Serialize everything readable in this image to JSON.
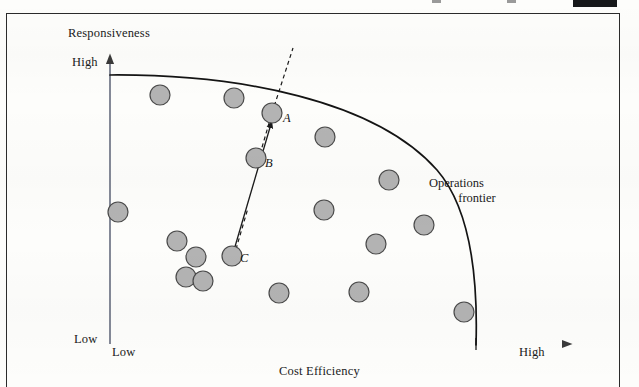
{
  "figure": {
    "kind": "operations-frontier-scatter",
    "frame_border_color": "#2b2b2b",
    "background_color": "#fdfdfb"
  },
  "axes": {
    "y_title": "Responsiveness",
    "y_high": "High",
    "y_low": "Low",
    "x_title": "Cost Efficiency",
    "x_low": "Low",
    "x_high": "High",
    "axis_color": "#3a3a3a"
  },
  "annotations": {
    "frontier_label_line1": "Operations",
    "frontier_label_line2": "frontier",
    "point_a_label": "A",
    "point_b_label": "B",
    "point_c_label": "C"
  },
  "style": {
    "circle_fill": "#b3b3b3",
    "circle_stroke": "#4a4a4a",
    "frontier_stroke": "#141414",
    "arrow_stroke": "#1a1a1a"
  },
  "chart_data": {
    "type": "scatter",
    "title": "",
    "xlabel": "Cost Efficiency",
    "ylabel": "Responsiveness",
    "xlim": [
      "Low",
      "High"
    ],
    "ylim": [
      "Low",
      "High"
    ],
    "grid": false,
    "legend": null,
    "annotations": [
      {
        "text": "Operations frontier",
        "x": 470,
        "y": 190
      },
      {
        "text": "A",
        "x": 283,
        "y": 118
      },
      {
        "text": "B",
        "x": 265,
        "y": 163
      },
      {
        "text": "C",
        "x": 240,
        "y": 258
      }
    ],
    "frontier_curve": {
      "description": "Concave operations frontier arc from upper-left to lower-right",
      "start": [
        110,
        75
      ],
      "control_1": [
        330,
        80
      ],
      "control_2": [
        470,
        160
      ],
      "end": [
        476,
        344
      ]
    },
    "improvement_arrow": {
      "from_point": "C",
      "through_point": "B",
      "to_point": "A",
      "solid_from": [
        234,
        255
      ],
      "arrow_head": [
        271,
        122
      ],
      "dashed_extends_to": [
        293,
        48
      ]
    },
    "points": [
      {
        "id": "p1",
        "x": 160,
        "y": 95,
        "r": 10,
        "on_frontier": false
      },
      {
        "id": "p2",
        "x": 234,
        "y": 98,
        "r": 10,
        "on_frontier": true
      },
      {
        "id": "A",
        "x": 272,
        "y": 113,
        "r": 10,
        "on_frontier": true,
        "label": "A"
      },
      {
        "id": "p4",
        "x": 325,
        "y": 137,
        "r": 10,
        "on_frontier": false
      },
      {
        "id": "B",
        "x": 256,
        "y": 158,
        "r": 10,
        "on_frontier": false,
        "label": "B"
      },
      {
        "id": "p6",
        "x": 389,
        "y": 180,
        "r": 10,
        "on_frontier": true
      },
      {
        "id": "p7",
        "x": 424,
        "y": 225,
        "r": 10,
        "on_frontier": true
      },
      {
        "id": "p8",
        "x": 118,
        "y": 212,
        "r": 10,
        "on_frontier": false
      },
      {
        "id": "p9",
        "x": 324,
        "y": 210,
        "r": 10,
        "on_frontier": false
      },
      {
        "id": "p10",
        "x": 177,
        "y": 241,
        "r": 10,
        "on_frontier": false
      },
      {
        "id": "p11",
        "x": 196,
        "y": 257,
        "r": 10,
        "on_frontier": false
      },
      {
        "id": "C",
        "x": 232,
        "y": 256,
        "r": 10,
        "on_frontier": false,
        "label": "C"
      },
      {
        "id": "p13",
        "x": 376,
        "y": 244,
        "r": 10,
        "on_frontier": false
      },
      {
        "id": "p14",
        "x": 186,
        "y": 277,
        "r": 10,
        "on_frontier": false
      },
      {
        "id": "p15",
        "x": 203,
        "y": 281,
        "r": 10,
        "on_frontier": false
      },
      {
        "id": "p16",
        "x": 279,
        "y": 293,
        "r": 10,
        "on_frontier": false
      },
      {
        "id": "p17",
        "x": 359,
        "y": 292,
        "r": 10,
        "on_frontier": false
      },
      {
        "id": "p18",
        "x": 464,
        "y": 312,
        "r": 10,
        "on_frontier": true
      }
    ]
  }
}
